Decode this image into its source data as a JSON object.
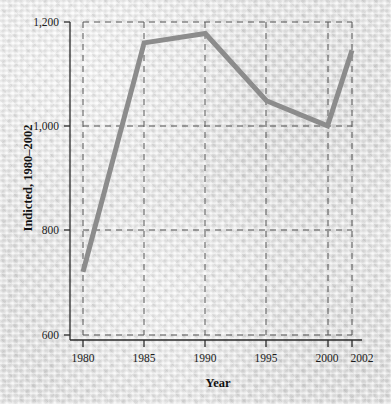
{
  "chart_data": {
    "type": "line",
    "title": "",
    "xlabel": "Year",
    "ylabel": "Indicted, 1980–2002",
    "x": [
      1980,
      1985,
      1990,
      1995,
      2000,
      2002
    ],
    "values": [
      721,
      1160,
      1178,
      1049,
      1001,
      1146
    ],
    "series": [
      {
        "name": "Indicted",
        "values": [
          721,
          1160,
          1178,
          1049,
          1001,
          1146
        ]
      }
    ],
    "xlim": [
      1980,
      2002
    ],
    "ylim": [
      600,
      1200
    ],
    "xticks": [
      1980,
      1985,
      1990,
      1995,
      2000,
      2002
    ],
    "xtick_labels": [
      "1980",
      "1985",
      "1990",
      "1995",
      "2000",
      "2002"
    ],
    "yticks": [
      600,
      800,
      1000,
      1200
    ],
    "ytick_labels": [
      "600",
      "800",
      "1,000",
      "1,200"
    ],
    "gridlines": {
      "x": [
        1980,
        1985,
        1990,
        1995,
        2000,
        2002
      ],
      "y": [
        600,
        800,
        1000,
        1200
      ],
      "style": "dashed",
      "on": true
    },
    "legend": {
      "entries": [],
      "position": "none"
    },
    "annotations": [],
    "colors": {
      "line": "#8c8c8c",
      "grid": "#5a5a5a",
      "axis": "#303030",
      "text": "#1c1c1c",
      "background": "#e9e9e9"
    },
    "line_width": 5
  }
}
